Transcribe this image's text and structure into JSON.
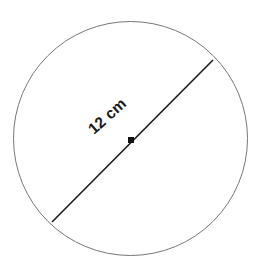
{
  "figure": {
    "name": "circle-with-diameter",
    "background_color": "#ffffff",
    "width": 260,
    "height": 269
  },
  "shapes": {
    "circle": {
      "name": "circle-outline",
      "center_x": 130.5,
      "center_y": 138.5,
      "radius": 117,
      "stroke_color": "#777777",
      "stroke_width": 1,
      "fill": "none"
    },
    "diameter": {
      "name": "diameter-segment",
      "label": "12 cm",
      "x1": 52,
      "y1": 222,
      "x2": 213,
      "y2": 60,
      "stroke_color": "#1a1a1a",
      "stroke_width": 1.6,
      "angle_degrees": -45
    },
    "center_point": {
      "name": "center-dot",
      "x": 131,
      "y": 140,
      "size": 6,
      "color": "#111111"
    }
  },
  "labels": {
    "diameter_label": {
      "text": "12 cm",
      "x": 108,
      "y": 117,
      "rotation_degrees": -42,
      "color": "#1a1a1a",
      "font_size": 15.5
    }
  },
  "chart_data": {
    "type": "diagram",
    "title": "",
    "measurements": [
      {
        "label": "12 cm",
        "quantity": "diameter",
        "value": 12,
        "unit": "cm"
      }
    ],
    "derived": [
      {
        "quantity": "radius",
        "value": 6,
        "unit": "cm"
      }
    ],
    "annotations": [
      "12 cm"
    ]
  }
}
